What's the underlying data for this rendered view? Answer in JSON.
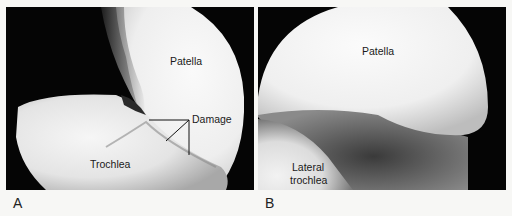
{
  "figure": {
    "panels": [
      {
        "letter": "A",
        "labels": {
          "patella": "Patella",
          "damage": "Damage",
          "trochlea": "Trochlea"
        }
      },
      {
        "letter": "B",
        "labels": {
          "patella": "Patella",
          "lateral_trochlea_line1": "Lateral",
          "lateral_trochlea_line2": "trochlea"
        }
      }
    ],
    "colors": {
      "background": "#f7f7f5",
      "scope_field": "#050505",
      "cartilage_light": "#f4f4f4",
      "cartilage_shadow": "#9a9a9a",
      "label_text": "#1a1a1a"
    }
  }
}
